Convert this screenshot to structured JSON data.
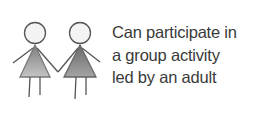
{
  "caption": {
    "lines": [
      "Can participate in",
      "a group activity",
      "led by an adult"
    ]
  },
  "illustration": {
    "icon": "two-girls-holding-hands-icon",
    "colors": {
      "head_fill": "#f2f2f2",
      "outline": "#555555",
      "dress_left": "#a8a8a8",
      "dress_right": "#8a8a8a"
    }
  }
}
